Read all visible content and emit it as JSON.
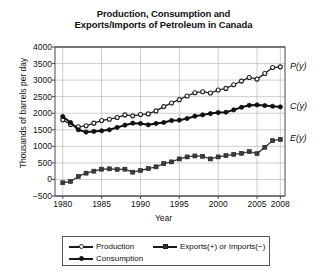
{
  "chart_data": {
    "type": "line",
    "title": "Production, Consumption and Exports/Imports of Petroleum in Canada",
    "title_lines": [
      "Production, Consumption and",
      "Exports/Imports of Petroleum in Canada"
    ],
    "xlabel": "Year",
    "ylabel": "Thousands of barrels per day",
    "xlim": [
      1979,
      2008.6
    ],
    "ylim": [
      -500,
      4000
    ],
    "xticks": [
      1980,
      1985,
      1990,
      1995,
      2000,
      2005,
      2008
    ],
    "xtick_labels": [
      "1980",
      "1985",
      "1990",
      "1995",
      "2000",
      "2005",
      "2008"
    ],
    "yticks": [
      -500,
      0,
      500,
      1000,
      1500,
      2000,
      2500,
      3000,
      3500,
      4000
    ],
    "ytick_labels": [
      "-500",
      "0",
      "500",
      "1000",
      "1500",
      "2000",
      "2500",
      "3000",
      "3500",
      "4000"
    ],
    "grid": true,
    "legend_position": "below",
    "x": [
      1980,
      1981,
      1982,
      1983,
      1984,
      1985,
      1986,
      1987,
      1988,
      1989,
      1990,
      1991,
      1992,
      1993,
      1994,
      1995,
      1996,
      1997,
      1998,
      1999,
      2000,
      2001,
      2002,
      2003,
      2004,
      2005,
      2006,
      2007,
      2008
    ],
    "series": [
      {
        "name": "Production",
        "label": "P(y)",
        "marker": "open-circle",
        "color": "#222222",
        "values": [
          1800,
          1660,
          1590,
          1620,
          1700,
          1780,
          1820,
          1870,
          1950,
          1920,
          1960,
          1980,
          2070,
          2200,
          2310,
          2410,
          2520,
          2620,
          2650,
          2610,
          2700,
          2750,
          2860,
          2970,
          3080,
          3030,
          3200,
          3380,
          3400
        ]
      },
      {
        "name": "Consumption",
        "label": "C(y)",
        "marker": "filled-circle",
        "color": "#111111",
        "values": [
          1900,
          1720,
          1500,
          1430,
          1450,
          1470,
          1500,
          1570,
          1640,
          1700,
          1690,
          1650,
          1690,
          1720,
          1780,
          1790,
          1840,
          1910,
          1950,
          1990,
          2020,
          2030,
          2100,
          2180,
          2240,
          2250,
          2230,
          2210,
          2190
        ]
      },
      {
        "name": "Exports(+) or Imports(−)",
        "label": "E(y)",
        "marker": "square",
        "color": "#3a3a3a",
        "values": [
          -100,
          -60,
          90,
          190,
          250,
          310,
          320,
          300,
          310,
          220,
          270,
          330,
          380,
          480,
          530,
          620,
          680,
          710,
          700,
          620,
          680,
          720,
          760,
          790,
          840,
          780,
          970,
          1170,
          1210
        ]
      }
    ],
    "legend_entries": [
      {
        "label": "Production",
        "marker": "open-circle"
      },
      {
        "label": "Exports(+) or Imports(−)",
        "marker": "square"
      },
      {
        "label": "Consumption",
        "marker": "filled-circle"
      }
    ]
  }
}
